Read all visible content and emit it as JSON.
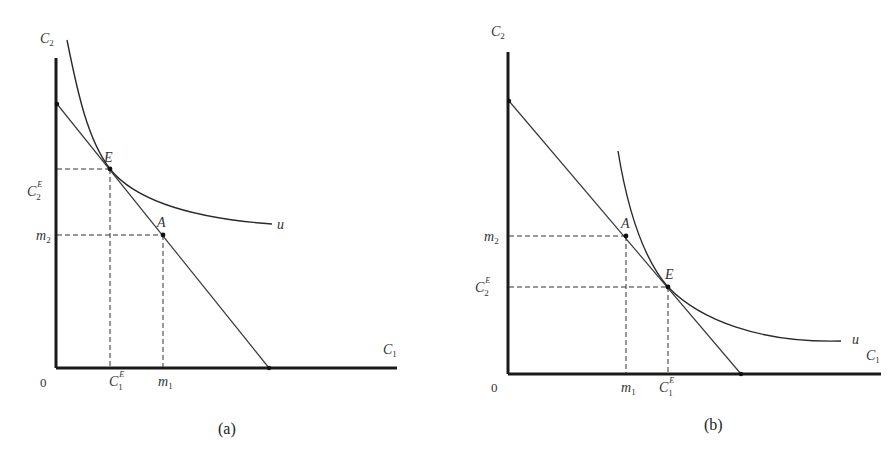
{
  "panels": [
    {
      "id": "a",
      "caption": "(a)",
      "y_axis_label": {
        "base": "C",
        "sub": "2"
      },
      "x_axis_label": {
        "base": "C",
        "sub": "1"
      },
      "origin_label": "0",
      "curve_label": "u",
      "points": {
        "E": {
          "label": "E"
        },
        "A": {
          "label": "A"
        }
      },
      "y_ticks": [
        {
          "base": "C",
          "sup": "E",
          "sub": "2"
        },
        {
          "base": "m",
          "sub": "2"
        }
      ],
      "x_ticks": [
        {
          "base": "C",
          "sup": "E",
          "sub": "1"
        },
        {
          "base": "m",
          "sub": "1"
        }
      ]
    },
    {
      "id": "b",
      "caption": "(b)",
      "y_axis_label": {
        "base": "C",
        "sub": "2"
      },
      "x_axis_label": {
        "base": "C",
        "sub": "1"
      },
      "origin_label": "0",
      "curve_label": "u",
      "points": {
        "A": {
          "label": "A"
        },
        "E": {
          "label": "E"
        }
      },
      "y_ticks": [
        {
          "base": "m",
          "sub": "2"
        },
        {
          "base": "C",
          "sup": "E",
          "sub": "2"
        }
      ],
      "x_ticks": [
        {
          "base": "m",
          "sub": "1"
        },
        {
          "base": "C",
          "sup": "E",
          "sub": "1"
        }
      ]
    }
  ]
}
